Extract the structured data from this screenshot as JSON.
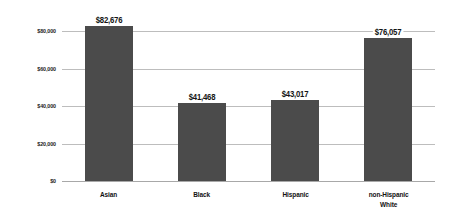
{
  "chart_data": {
    "type": "bar",
    "title": "",
    "subtitle": "",
    "xlabel": "",
    "ylabel": "",
    "categories": [
      "Asian",
      "Black",
      "Hispanic",
      "non-Hispanic White"
    ],
    "category_labels": [
      {
        "line1": "Asian",
        "line2": ""
      },
      {
        "line1": "Black",
        "line2": ""
      },
      {
        "line1": "Hispanic",
        "line2": ""
      },
      {
        "line1": "non-Hispanic",
        "line2": "White"
      }
    ],
    "values": [
      82676,
      41468,
      43017,
      76057
    ],
    "value_labels": [
      "$82,676",
      "$41,468",
      "$43,017",
      "$76,057"
    ],
    "ylim": [
      0,
      80000
    ],
    "yticks": [
      0,
      20000,
      40000,
      60000,
      80000
    ],
    "ytick_labels": [
      "$0",
      "$20,000",
      "$40,000",
      "$60,000",
      "$80,000"
    ],
    "grid": true,
    "legend": false,
    "legend_position": "none",
    "bar_color": "#4b4b4b",
    "gridline_color": "#bdbdbd",
    "background_color": "#ffffff",
    "text_color": "#141414"
  }
}
